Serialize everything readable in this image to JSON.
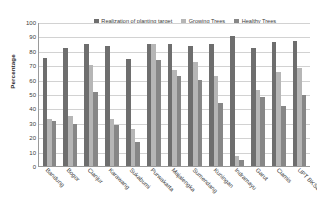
{
  "chart_data": {
    "type": "bar",
    "title": "",
    "xlabel": "",
    "ylabel": "Percentage",
    "ylim": [
      0,
      100
    ],
    "ytick_step": 10,
    "yticks": [
      100,
      90,
      80,
      70,
      60,
      50,
      40,
      30,
      20,
      10,
      0
    ],
    "grid": true,
    "legend_position": "top-center",
    "categories": [
      "Bandung",
      "Bogor",
      "Cianjur",
      "Karawang",
      "Sukabumi",
      "Purwakarta",
      "Majalengka",
      "Sumendang",
      "Kuningan",
      "Indramayu",
      "Garut",
      "Ciamis",
      "UPT BKSD Jabar II"
    ],
    "series": [
      {
        "name": "Realization of planting target",
        "color": "#6e6e6e",
        "values": [
          75,
          82,
          85,
          83.5,
          74.5,
          84.5,
          84.5,
          83.5,
          84.5,
          90,
          82,
          86,
          86.5
        ]
      },
      {
        "name": "Growing Trees",
        "color": "#b6b6b6",
        "values": [
          32.5,
          34.5,
          70,
          32.5,
          26,
          85,
          67,
          72.5,
          62.5,
          7,
          53,
          65,
          68
        ]
      },
      {
        "name": "Healthy Trees",
        "color": "#878787",
        "values": [
          31,
          29.5,
          51.5,
          28.5,
          16.5,
          73.5,
          62.5,
          59.5,
          44,
          4.5,
          48,
          42,
          49
        ]
      }
    ]
  },
  "legend": {
    "entries": [
      {
        "label": "Realization of planting target"
      },
      {
        "label": "Growing Trees"
      },
      {
        "label": "Healthy Trees"
      }
    ]
  },
  "axes": {
    "y_title": "Percentage"
  }
}
